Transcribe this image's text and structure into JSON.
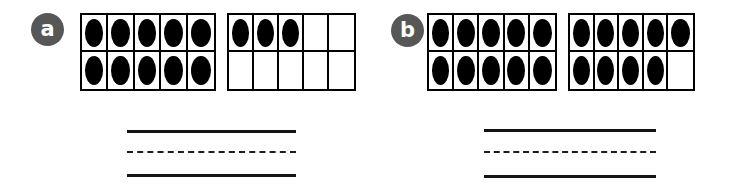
{
  "worksheet": {
    "type": "ten-frame-counting-worksheet",
    "background_color": "#ffffff",
    "badge_color": "#575757",
    "counter_color": "#000000",
    "frame_border_color": "#000000",
    "line_color": "#141414"
  },
  "problems": [
    {
      "label": "a",
      "frames": [
        {
          "name": "frame-1",
          "rows": [
            [
              "filled",
              "filled",
              "filled",
              "filled",
              "filled"
            ],
            [
              "filled",
              "filled",
              "filled",
              "filled",
              "filled"
            ]
          ],
          "filled_count": 10
        },
        {
          "name": "frame-2",
          "rows": [
            [
              "filled",
              "filled",
              "filled",
              "empty",
              "empty"
            ],
            [
              "empty",
              "empty",
              "empty",
              "empty",
              "empty"
            ]
          ],
          "filled_count": 3
        }
      ],
      "total": 13,
      "answer_lines": {
        "top": "solid",
        "middle": "dashed",
        "bottom": "solid",
        "answer_value": ""
      }
    },
    {
      "label": "b",
      "frames": [
        {
          "name": "frame-1",
          "rows": [
            [
              "filled",
              "filled",
              "filled",
              "filled",
              "filled"
            ],
            [
              "filled",
              "filled",
              "filled",
              "filled",
              "filled"
            ]
          ],
          "filled_count": 10
        },
        {
          "name": "frame-2",
          "rows": [
            [
              "filled",
              "filled",
              "filled",
              "filled",
              "filled"
            ],
            [
              "filled",
              "filled",
              "filled",
              "filled",
              "empty"
            ]
          ],
          "filled_count": 9
        }
      ],
      "total": 19,
      "answer_lines": {
        "top": "solid",
        "middle": "dashed",
        "bottom": "solid",
        "answer_value": ""
      }
    }
  ]
}
